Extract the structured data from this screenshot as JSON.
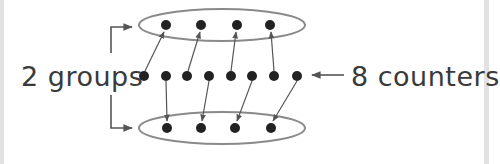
{
  "diagram": {
    "type": "grouping-illustration",
    "labels": {
      "groups": "2 groups",
      "counters": "8 counters"
    },
    "colors": {
      "background": "#ffffff",
      "border": "#e2e2e2",
      "counter_fill": "#222222",
      "ellipse_stroke": "#8a8a8a",
      "arrow_stroke": "#555555",
      "text": "#3a3a3a"
    },
    "counters_total": 8,
    "groups_total": 2,
    "counters_per_group": 4,
    "middle_row": {
      "y": 76,
      "x": [
        140,
        162,
        183,
        205,
        227,
        248,
        270,
        293
      ]
    },
    "groups": [
      {
        "name": "top-group",
        "ellipse": {
          "cx": 218,
          "cy": 25,
          "rx": 83,
          "ry": 16
        },
        "counters_x": [
          162,
          197,
          233,
          266
        ],
        "from_middle_indices": [
          0,
          2,
          4,
          6
        ]
      },
      {
        "name": "bottom-group",
        "ellipse": {
          "cx": 218,
          "cy": 128,
          "rx": 83,
          "ry": 16
        },
        "counters_x": [
          163,
          197,
          231,
          267
        ],
        "from_middle_indices": [
          1,
          3,
          5,
          7
        ]
      }
    ]
  }
}
